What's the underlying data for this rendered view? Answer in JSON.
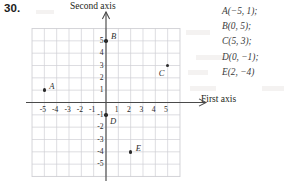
{
  "problem": {
    "number": "30."
  },
  "axes": {
    "first_axis_title": "First axis",
    "second_axis_title": "Second axis",
    "x_ticks": [
      "-5",
      "-4",
      "-3",
      "-2",
      "-1",
      "1",
      "2",
      "3",
      "4",
      "5"
    ],
    "y_ticks": [
      "5",
      "4",
      "3",
      "2",
      "1",
      "-1",
      "-2",
      "-3",
      "-4",
      "-5"
    ]
  },
  "answers": {
    "lines": [
      "A(−5, 1);",
      "B(0, 5);",
      "C(5, 3);",
      "D(0, −1);",
      "E(2, −4)"
    ]
  },
  "chart_data": {
    "type": "scatter",
    "title": "",
    "xlabel": "First axis",
    "ylabel": "Second axis",
    "xlim": [
      -6,
      6
    ],
    "ylim": [
      -6,
      6
    ],
    "grid": true,
    "legend": "none",
    "xticks": [
      -5,
      -4,
      -3,
      -2,
      -1,
      1,
      2,
      3,
      4,
      5
    ],
    "yticks": [
      5,
      4,
      3,
      2,
      1,
      -1,
      -2,
      -3,
      -4,
      -5
    ],
    "points": [
      {
        "label": "A",
        "x": -5,
        "y": 1,
        "label_dx": 5,
        "label_dy": -8
      },
      {
        "label": "B",
        "x": 0,
        "y": 5,
        "label_dx": 5,
        "label_dy": -9
      },
      {
        "label": "C",
        "x": 5,
        "y": 3,
        "label_dx": -9,
        "label_dy": 3
      },
      {
        "label": "D",
        "x": 0,
        "y": -1,
        "label_dx": 4,
        "label_dy": 2
      },
      {
        "label": "E",
        "x": 2,
        "y": -4,
        "label_dx": 5,
        "label_dy": -8
      }
    ]
  }
}
